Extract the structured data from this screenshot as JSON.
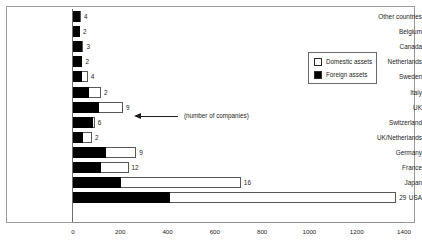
{
  "chart_data": {
    "type": "bar",
    "orientation": "horizontal",
    "stacked": true,
    "title": "",
    "xlabel": "",
    "ylabel": "",
    "xlim": [
      0,
      1400
    ],
    "xticks": [
      0,
      200,
      400,
      600,
      800,
      1000,
      1200,
      1400
    ],
    "xtick_labels": [
      "0",
      "200",
      "400",
      "600",
      "800",
      "1000",
      "1200",
      "1400"
    ],
    "grid": false,
    "categories": [
      "Other countries",
      "Belgium",
      "Canada",
      "Netherlands",
      "Sweden",
      "Italy",
      "UK",
      "Switzerland",
      "UK/Netherlands",
      "Germany",
      "France",
      "Japan",
      "USA"
    ],
    "series": [
      {
        "name": "Foreign assets",
        "color": "#000000",
        "values": [
          30,
          28,
          38,
          36,
          40,
          66,
          110,
          84,
          44,
          140,
          118,
          205,
          409
        ]
      },
      {
        "name": "Domestic assets",
        "color": "#ffffff",
        "values": [
          4,
          2,
          6,
          4,
          22,
          52,
          102,
          8,
          36,
          127,
          117,
          505,
          958
        ]
      }
    ],
    "totals": [
      34,
      30,
      44,
      40,
      62,
      118,
      212,
      92,
      80,
      267,
      235,
      710,
      1367
    ],
    "data_labels": [
      "4",
      "2",
      "3",
      "2",
      "4",
      "2",
      "9",
      "6",
      "2",
      "9",
      "12",
      "16",
      "29"
    ],
    "data_label_meaning": "(number of companies)",
    "legend": {
      "position": "upper-right-inside",
      "entries": [
        {
          "label": "Domestic assets",
          "swatch": "white"
        },
        {
          "label": "Foreign assets",
          "swatch": "black"
        }
      ]
    },
    "annotation": {
      "text": "(number of companies)",
      "arrow": "left-arrow-icon",
      "points_to": "UK"
    }
  }
}
